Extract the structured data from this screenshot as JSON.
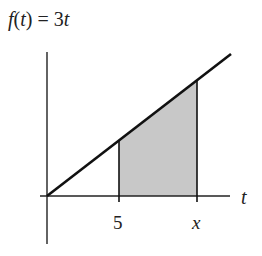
{
  "diagram": {
    "title": "f(t) = 3t",
    "title_parts": {
      "f": "f",
      "open": "(",
      "t": "t",
      "close": ") = 3",
      "t2": "t"
    },
    "axis_label_x": "t",
    "tick_labels": {
      "a": "5",
      "b": "x"
    },
    "shaded_region": "area under f(t)=3t from t=5 to t=x",
    "colors": {
      "line": "#111111",
      "shade": "#c8c8c8",
      "axis": "#222222"
    }
  }
}
